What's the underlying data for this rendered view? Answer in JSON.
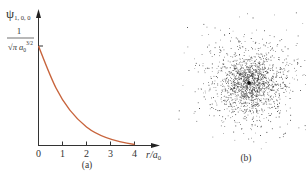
{
  "figure": {
    "panel_a": {
      "caption": "(a)",
      "y_axis_label": "ψ",
      "y_axis_subscript": "1, 0, 0",
      "y_tick_numerator": "1",
      "y_tick_denominator_main": "√π a",
      "y_tick_denominator_sub": "0",
      "y_tick_denominator_sup": "3/2",
      "x_axis_label_main": "r/a",
      "x_axis_label_sub": "0",
      "x_ticks": [
        "0",
        "1",
        "2",
        "3",
        "4"
      ],
      "curve_color": "#c8643c"
    },
    "panel_b": {
      "caption": "(b)",
      "description": "electron probability cloud (dot density plot) centered on nucleus"
    }
  },
  "chart_data": {
    "type": "line",
    "title": "",
    "xlabel": "r/a0",
    "ylabel": "ψ_{1,0,0}",
    "x": [
      0,
      0.5,
      1,
      1.5,
      2,
      2.5,
      3,
      3.5,
      4
    ],
    "series": [
      {
        "name": "ψ_{1,0,0} = (1/(√π a0^{3/2})) e^{-r/a0}",
        "values": [
          1.0,
          0.607,
          0.368,
          0.223,
          0.135,
          0.082,
          0.05,
          0.03,
          0.018
        ]
      }
    ],
    "y_tick_labels": [
      "1/(√π a0^{3/2})"
    ],
    "x_tick_labels": [
      "0",
      "1",
      "2",
      "3",
      "4"
    ],
    "xlim": [
      0,
      4.5
    ],
    "ylim": [
      0,
      1.1
    ],
    "grid": false,
    "legend": "none"
  }
}
